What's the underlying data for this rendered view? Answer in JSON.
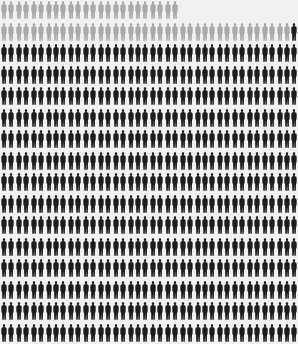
{
  "chart_data": {
    "type": "pictogram",
    "title": "",
    "columns": 40,
    "rows": 16,
    "series": [
      {
        "name": "gray figures",
        "color": "#a9a9a9",
        "count": 63
      },
      {
        "name": "black figures",
        "color": "#1c1c1c",
        "count": 561
      }
    ],
    "row_layout": [
      {
        "row": 1,
        "gray": 24,
        "black": 0,
        "empty": 16
      },
      {
        "row": 2,
        "gray": 39,
        "black": 1,
        "empty": 0
      },
      {
        "row": 3,
        "gray": 0,
        "black": 40,
        "empty": 0
      },
      {
        "row": 4,
        "gray": 0,
        "black": 40,
        "empty": 0
      },
      {
        "row": 5,
        "gray": 0,
        "black": 40,
        "empty": 0
      },
      {
        "row": 6,
        "gray": 0,
        "black": 40,
        "empty": 0
      },
      {
        "row": 7,
        "gray": 0,
        "black": 40,
        "empty": 0
      },
      {
        "row": 8,
        "gray": 0,
        "black": 40,
        "empty": 0
      },
      {
        "row": 9,
        "gray": 0,
        "black": 40,
        "empty": 0
      },
      {
        "row": 10,
        "gray": 0,
        "black": 40,
        "empty": 0
      },
      {
        "row": 11,
        "gray": 0,
        "black": 40,
        "empty": 0
      },
      {
        "row": 12,
        "gray": 0,
        "black": 40,
        "empty": 0
      },
      {
        "row": 13,
        "gray": 0,
        "black": 40,
        "empty": 0
      },
      {
        "row": 14,
        "gray": 0,
        "black": 40,
        "empty": 0
      },
      {
        "row": 15,
        "gray": 0,
        "black": 40,
        "empty": 0
      },
      {
        "row": 16,
        "gray": 0,
        "black": 40,
        "empty": 0
      }
    ],
    "icon": "standing-person-silhouette",
    "background": "#f1f1f1"
  }
}
